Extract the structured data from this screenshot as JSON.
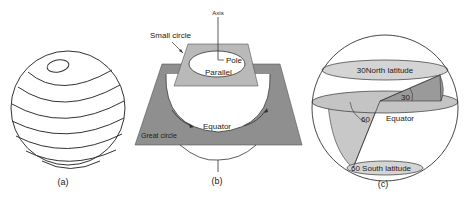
{
  "panels": {
    "a": {
      "caption": "(a)"
    },
    "b": {
      "caption": "(b)",
      "labels": {
        "axis": "Axis",
        "small_circle": "Small circle",
        "pole": "Pole",
        "parallel": "Parallel",
        "equator": "Equator",
        "great_circle": "Great circle"
      }
    },
    "c": {
      "caption": "(c)",
      "labels": {
        "north_latitude": "30North latitude",
        "angle_30": "30",
        "angle_60": "60",
        "equator": "Equator",
        "south_latitude": "60 South latitude"
      }
    }
  },
  "colors": {
    "plane_dark": "#8f8f8f",
    "plane_light": "#b9b9b9",
    "ellipse_fill": "#d4d4d4",
    "wedge_dark": "#9a9a9a",
    "wedge_light": "#c8c8c8",
    "line": "#333333"
  }
}
